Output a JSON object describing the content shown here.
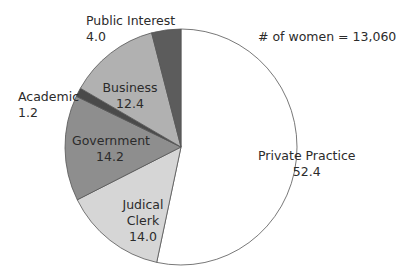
{
  "chart_data": {
    "type": "pie",
    "title": "",
    "annotation": "# of women = 13,060",
    "unit": "percent",
    "start_angle": "12 o'clock, clockwise",
    "slices": [
      {
        "label": "Private Practice",
        "value": 52.4,
        "color": "#ffffff"
      },
      {
        "label": "Judical Clerk",
        "value": 14.0,
        "color": "#d6d6d6"
      },
      {
        "label": "Government",
        "value": 14.2,
        "color": "#8e8e8e"
      },
      {
        "label": "Academic",
        "value": 1.2,
        "color": "#4a4a4a"
      },
      {
        "label": "Business",
        "value": 12.4,
        "color": "#b1b1b1"
      },
      {
        "label": "Public Interest",
        "value": 4.0,
        "color": "#5c5c5c"
      }
    ],
    "categories": [
      "Private Practice",
      "Judical Clerk",
      "Government",
      "Academic",
      "Business",
      "Public Interest"
    ],
    "values": [
      52.4,
      14.0,
      14.2,
      1.2,
      12.4,
      4.0
    ]
  },
  "labels": {
    "private": {
      "name": "Private Practice",
      "value": "52.4"
    },
    "judicial": {
      "name1": "Judical",
      "name2": "Clerk",
      "value": "14.0"
    },
    "government": {
      "name": "Government",
      "value": "14.2"
    },
    "academic": {
      "name": "Academic",
      "value": "1.2"
    },
    "business": {
      "name": "Business",
      "value": "12.4"
    },
    "public": {
      "name": "Public Interest",
      "value": "4.0"
    }
  },
  "note": "# of women = 13,060"
}
